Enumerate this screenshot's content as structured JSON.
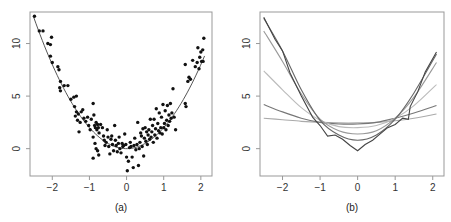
{
  "chart_data": [
    {
      "panel_label": "(a)",
      "type": "scatter",
      "title": "",
      "xlabel": "",
      "ylabel": "",
      "xlim": [
        -2.6,
        2.3
      ],
      "ylim": [
        -2.6,
        13.0
      ],
      "xticks": [
        -2,
        -1,
        0,
        1,
        2
      ],
      "xtick_labels": [
        "−2",
        "−1",
        "0",
        "1",
        "2"
      ],
      "yticks": [
        0,
        5,
        10
      ],
      "ytick_labels": [
        "0",
        "5",
        "10"
      ],
      "grid": false,
      "points": [
        [
          -2.48,
          12.6
        ],
        [
          -2.35,
          11.2
        ],
        [
          -2.25,
          11.2
        ],
        [
          -2.12,
          10.0
        ],
        [
          -2.05,
          9.9
        ],
        [
          -2.02,
          10.6
        ],
        [
          -2.05,
          8.8
        ],
        [
          -2.0,
          8.2
        ],
        [
          -1.85,
          7.8
        ],
        [
          -1.82,
          7.5
        ],
        [
          -1.78,
          6.4
        ],
        [
          -1.8,
          5.8
        ],
        [
          -1.78,
          5.5
        ],
        [
          -1.68,
          6.0
        ],
        [
          -1.58,
          6.0
        ],
        [
          -1.5,
          4.7
        ],
        [
          -1.42,
          4.9
        ],
        [
          -1.35,
          5.0
        ],
        [
          -1.4,
          4.0
        ],
        [
          -1.35,
          3.5
        ],
        [
          -1.3,
          3.3
        ],
        [
          -1.38,
          3.1
        ],
        [
          -1.32,
          2.7
        ],
        [
          -1.25,
          2.5
        ],
        [
          -1.22,
          3.5
        ],
        [
          -1.18,
          3.7
        ],
        [
          -1.28,
          1.6
        ],
        [
          -1.15,
          2.9
        ],
        [
          -1.1,
          2.6
        ],
        [
          -1.05,
          3.0
        ],
        [
          -1.02,
          2.2
        ],
        [
          -0.98,
          1.8
        ],
        [
          -0.95,
          2.8
        ],
        [
          -0.9,
          4.3
        ],
        [
          -0.88,
          3.2
        ],
        [
          -0.86,
          2.2
        ],
        [
          -0.84,
          2.0
        ],
        [
          -0.82,
          2.5
        ],
        [
          -0.8,
          1.8
        ],
        [
          -0.78,
          2.3
        ],
        [
          -0.76,
          2.0
        ],
        [
          -0.74,
          1.5
        ],
        [
          -0.9,
          1.1
        ],
        [
          -0.85,
          0.5
        ],
        [
          -0.82,
          0.0
        ],
        [
          -0.78,
          -0.2
        ],
        [
          -0.9,
          -0.9
        ],
        [
          -0.75,
          -0.6
        ],
        [
          -0.7,
          2.3
        ],
        [
          -0.65,
          2.0
        ],
        [
          -0.62,
          1.2
        ],
        [
          -0.6,
          0.8
        ],
        [
          -0.58,
          0.3
        ],
        [
          -0.55,
          0.6
        ],
        [
          -0.52,
          1.8
        ],
        [
          -0.5,
          1.1
        ],
        [
          -0.48,
          0.2
        ],
        [
          -0.45,
          -0.5
        ],
        [
          -0.42,
          0.9
        ],
        [
          -0.4,
          1.2
        ],
        [
          -0.38,
          0.4
        ],
        [
          -0.35,
          -0.2
        ],
        [
          -0.32,
          2.2
        ],
        [
          -0.3,
          0.8
        ],
        [
          -0.28,
          0.3
        ],
        [
          -0.25,
          -0.3
        ],
        [
          -0.22,
          0.5
        ],
        [
          -0.2,
          1.1
        ],
        [
          -0.18,
          0.0
        ],
        [
          -0.15,
          -0.4
        ],
        [
          -0.12,
          0.5
        ],
        [
          -0.1,
          0.2
        ],
        [
          -0.08,
          0.3
        ],
        [
          -0.05,
          1.4
        ],
        [
          -0.02,
          0.4
        ],
        [
          0.0,
          -0.8
        ],
        [
          0.02,
          -2.1
        ],
        [
          0.05,
          -1.2
        ],
        [
          0.08,
          0.1
        ],
        [
          0.1,
          0.6
        ],
        [
          0.12,
          0.2
        ],
        [
          0.15,
          -0.8
        ],
        [
          0.18,
          -1.8
        ],
        [
          0.2,
          0.3
        ],
        [
          0.22,
          1.0
        ],
        [
          0.25,
          -0.1
        ],
        [
          0.28,
          0.4
        ],
        [
          0.3,
          2.5
        ],
        [
          0.32,
          -1.6
        ],
        [
          0.34,
          0.0
        ],
        [
          0.36,
          0.6
        ],
        [
          0.38,
          1.5
        ],
        [
          0.4,
          1.2
        ],
        [
          0.42,
          0.2
        ],
        [
          0.44,
          1.9
        ],
        [
          0.46,
          -0.7
        ],
        [
          0.48,
          1.0
        ],
        [
          0.5,
          2.0
        ],
        [
          0.52,
          0.7
        ],
        [
          0.54,
          1.6
        ],
        [
          0.56,
          0.4
        ],
        [
          0.58,
          1.3
        ],
        [
          0.6,
          1.8
        ],
        [
          0.62,
          0.9
        ],
        [
          0.64,
          2.8
        ],
        [
          0.66,
          1.1
        ],
        [
          0.68,
          1.6
        ],
        [
          0.7,
          2.2
        ],
        [
          0.72,
          0.6
        ],
        [
          0.74,
          2.8
        ],
        [
          0.76,
          1.3
        ],
        [
          0.78,
          1.9
        ],
        [
          0.8,
          3.8
        ],
        [
          0.82,
          1.0
        ],
        [
          0.84,
          2.4
        ],
        [
          0.86,
          1.7
        ],
        [
          0.88,
          3.4
        ],
        [
          0.9,
          1.5
        ],
        [
          0.92,
          2.0
        ],
        [
          0.94,
          3.0
        ],
        [
          0.96,
          1.4
        ],
        [
          0.98,
          4.2
        ],
        [
          1.0,
          2.0
        ],
        [
          1.02,
          2.4
        ],
        [
          1.04,
          3.6
        ],
        [
          1.06,
          1.8
        ],
        [
          1.08,
          2.7
        ],
        [
          1.1,
          4.1
        ],
        [
          1.12,
          2.2
        ],
        [
          1.14,
          3.2
        ],
        [
          1.16,
          2.6
        ],
        [
          1.18,
          4.3
        ],
        [
          1.2,
          2.9
        ],
        [
          1.22,
          3.4
        ],
        [
          1.25,
          5.7
        ],
        [
          1.28,
          3.0
        ],
        [
          1.32,
          1.8
        ],
        [
          1.58,
          8.0
        ],
        [
          1.58,
          4.3
        ],
        [
          1.6,
          4.0
        ],
        [
          1.65,
          6.4
        ],
        [
          1.68,
          6.8
        ],
        [
          1.72,
          6.6
        ],
        [
          1.78,
          8.4
        ],
        [
          1.85,
          7.8
        ],
        [
          1.9,
          8.2
        ],
        [
          1.92,
          9.6
        ],
        [
          1.95,
          7.6
        ],
        [
          1.97,
          8.7
        ],
        [
          2.0,
          9.2
        ],
        [
          2.02,
          8.3
        ],
        [
          2.05,
          9.4
        ],
        [
          2.06,
          8.3
        ],
        [
          2.08,
          10.5
        ]
      ],
      "fit_curve": {
        "description": "smooth fitted curve",
        "formula": "y = 2x^2",
        "x_range": [
          -2.5,
          2.1
        ]
      },
      "colors": {
        "points": "#111111",
        "curve": "#555555",
        "axes": "#999999"
      }
    },
    {
      "panel_label": "(b)",
      "type": "line",
      "title": "",
      "xlabel": "",
      "ylabel": "",
      "xlim": [
        -2.6,
        2.3
      ],
      "ylim": [
        -2.6,
        13.0
      ],
      "xticks": [
        -2,
        -1,
        0,
        1,
        2
      ],
      "xtick_labels": [
        "−2",
        "−1",
        "0",
        "1",
        "2"
      ],
      "yticks": [
        0,
        5,
        10
      ],
      "ytick_labels": [
        "0",
        "5",
        "10"
      ],
      "grid": false,
      "series": [
        {
          "name": "smooth-1",
          "x": [
            -2.5,
            -2.0,
            -1.5,
            -1.0,
            -0.5,
            0.0,
            0.5,
            1.0,
            1.5,
            2.1
          ],
          "y": [
            2.9,
            2.75,
            2.6,
            2.5,
            2.45,
            2.45,
            2.5,
            2.65,
            2.9,
            3.3
          ],
          "color": "#aaaaaa"
        },
        {
          "name": "smooth-2",
          "x": [
            -2.5,
            -2.0,
            -1.5,
            -1.0,
            -0.5,
            0.0,
            0.5,
            1.0,
            1.5,
            2.1
          ],
          "y": [
            4.2,
            3.5,
            2.9,
            2.5,
            2.35,
            2.35,
            2.5,
            2.9,
            3.4,
            4.1
          ],
          "color": "#777777"
        },
        {
          "name": "smooth-3",
          "x": [
            -2.5,
            -2.0,
            -1.5,
            -1.0,
            -0.5,
            0.0,
            0.5,
            1.0,
            1.5,
            2.1
          ],
          "y": [
            7.4,
            5.6,
            3.9,
            2.7,
            2.1,
            2.0,
            2.2,
            2.9,
            4.1,
            6.1
          ],
          "color": "#bbbbbb"
        },
        {
          "name": "smooth-4",
          "x": [
            -2.5,
            -2.0,
            -1.5,
            -1.0,
            -0.5,
            0.0,
            0.5,
            1.0,
            1.5,
            2.1
          ],
          "y": [
            11.2,
            8.3,
            5.2,
            2.8,
            1.7,
            1.4,
            1.7,
            2.9,
            4.9,
            8.2
          ],
          "color": "#999999"
        },
        {
          "name": "smooth-5",
          "x": [
            -2.5,
            -2.0,
            -1.5,
            -1.0,
            -0.5,
            0.0,
            0.5,
            1.0,
            1.5,
            2.1
          ],
          "y": [
            12.4,
            9.3,
            5.6,
            2.7,
            1.3,
            0.8,
            1.3,
            2.8,
            5.3,
            9.0
          ],
          "color": "#666666"
        },
        {
          "name": "interp",
          "x": [
            -2.5,
            -2.2,
            -2.0,
            -1.8,
            -1.5,
            -1.2,
            -1.0,
            -0.8,
            -0.6,
            -0.4,
            -0.2,
            0.0,
            0.2,
            0.4,
            0.6,
            0.8,
            1.0,
            1.2,
            1.35,
            1.4,
            1.6,
            1.8,
            2.1
          ],
          "y": [
            12.5,
            10.4,
            9.3,
            7.2,
            5.0,
            3.0,
            2.2,
            1.2,
            1.3,
            0.9,
            0.3,
            -0.2,
            0.4,
            0.8,
            1.4,
            2.0,
            2.3,
            2.9,
            2.8,
            4.0,
            5.4,
            7.3,
            9.2
          ],
          "color": "#444444"
        }
      ],
      "colors": {
        "axes": "#999999"
      }
    }
  ]
}
